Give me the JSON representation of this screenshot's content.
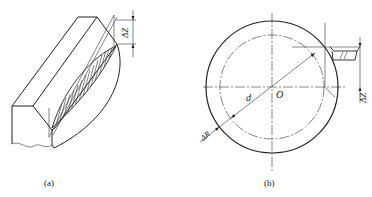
{
  "figure_a": {
    "caption": "(a)",
    "dimension_label": "ΔZ"
  },
  "figure_b": {
    "caption": "(b)",
    "center_label": "O",
    "diameter_label": "d",
    "radial_label": "ΔR",
    "dimension_label": "ΔZ"
  }
}
